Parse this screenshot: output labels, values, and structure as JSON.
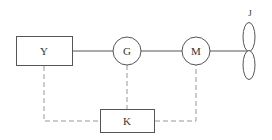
{
  "diagram": {
    "type": "block-diagram",
    "colors": {
      "stroke": "#555555",
      "dashed": "#999999",
      "text": "#333333",
      "background": "#ffffff"
    },
    "nodes": {
      "Y": {
        "label": "Y",
        "shape": "rectangle"
      },
      "G": {
        "label": "G",
        "shape": "circle"
      },
      "M": {
        "label": "M",
        "shape": "circle"
      },
      "J": {
        "label": "J",
        "shape": "propeller"
      },
      "K": {
        "label": "K",
        "shape": "rectangle"
      }
    },
    "edges": [
      {
        "from": "Y",
        "to": "G",
        "style": "solid"
      },
      {
        "from": "G",
        "to": "M",
        "style": "solid"
      },
      {
        "from": "M",
        "to": "J",
        "style": "solid"
      },
      {
        "from": "Y",
        "to": "K",
        "style": "dashed"
      },
      {
        "from": "G",
        "to": "K",
        "style": "dashed"
      },
      {
        "from": "M",
        "to": "K",
        "style": "dashed"
      }
    ]
  }
}
